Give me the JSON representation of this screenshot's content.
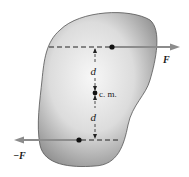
{
  "figure": {
    "labels": {
      "force_right": "F",
      "force_left": "−F",
      "distance_top": "d",
      "distance_bottom": "d",
      "center_of_mass": "c. m."
    },
    "colors": {
      "body_fill_light": "#f4f4f4",
      "body_fill_dark": "#9a9a9a",
      "body_outline": "#555555",
      "arrow": "#8c8c8c",
      "line": "#222222"
    }
  }
}
